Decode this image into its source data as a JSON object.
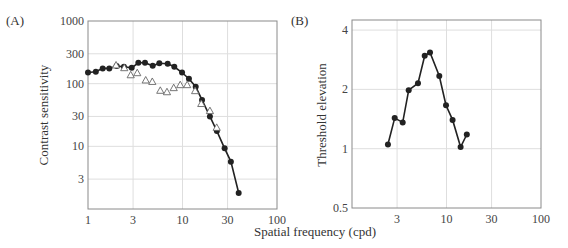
{
  "figure": {
    "x_axis_title": "Spatial frequency (cpd)"
  },
  "chart_data": [
    {
      "panel": "(A)",
      "type": "line",
      "title": "",
      "xlabel": "Spatial frequency (cpd)",
      "ylabel": "Contrast sensitivity",
      "xscale": "log",
      "yscale": "log",
      "xlim": [
        1,
        100
      ],
      "ylim": [
        1,
        1000
      ],
      "x_ticks": [
        "1",
        "3",
        "10",
        "30",
        "100"
      ],
      "y_ticks": [
        "3",
        "10",
        "30",
        "100",
        "300",
        "1000"
      ],
      "grid": true,
      "legend": null,
      "series": [
        {
          "name": "filled circles (connected)",
          "marker": "filled-circle",
          "line": true,
          "x": [
            1.0,
            1.21,
            1.43,
            1.68,
            2.01,
            2.4,
            2.9,
            3.41,
            4.01,
            4.84,
            5.68,
            6.97,
            8.19,
            9.89,
            11.7,
            13.8,
            16.1,
            19.5,
            23.1,
            27.9,
            32.5,
            39.3
          ],
          "y": [
            151,
            155,
            175,
            175,
            191,
            186,
            179,
            215,
            215,
            193,
            211,
            208,
            186,
            151,
            120,
            89,
            55,
            30,
            17.5,
            9.3,
            5.7,
            1.8
          ]
        },
        {
          "name": "open triangles",
          "marker": "open-triangle",
          "line": false,
          "x": [
            1.98,
            2.42,
            2.83,
            3.32,
            4.08,
            4.79,
            5.82,
            6.85,
            8.07,
            9.46,
            11.2,
            13.6,
            15.8,
            19.5,
            23.0
          ],
          "y": [
            198,
            179,
            138,
            149,
            114,
            108,
            78,
            74,
            86,
            96,
            96,
            77,
            48,
            37,
            20
          ]
        }
      ]
    },
    {
      "panel": "(B)",
      "type": "line",
      "title": "",
      "xlabel": "Spatial frequency (cpd)",
      "ylabel": "Threshold elevation",
      "xscale": "log",
      "yscale": "log",
      "xlim": [
        1,
        100
      ],
      "ylim": [
        0.5,
        4.5
      ],
      "x_ticks": [
        "3",
        "10",
        "30",
        "100"
      ],
      "y_ticks": [
        "0.5",
        "1",
        "2",
        "4"
      ],
      "grid": true,
      "legend": null,
      "series": [
        {
          "name": "filled circles (connected)",
          "marker": "filled-circle",
          "line": true,
          "x": [
            2.4,
            2.83,
            3.44,
            3.98,
            4.99,
            5.88,
            6.69,
            8.39,
            9.88,
            11.6,
            14.1,
            16.4
          ],
          "y": [
            1.05,
            1.43,
            1.36,
            1.98,
            2.15,
            2.96,
            3.08,
            2.34,
            1.66,
            1.4,
            1.02,
            1.18
          ]
        }
      ]
    }
  ],
  "colors": {
    "series_line": "#222222",
    "marker_fill": "#222222",
    "triangle_stroke": "#666666",
    "frame": "#8a8a8a",
    "grid": "#dedede",
    "text": "#333333"
  }
}
